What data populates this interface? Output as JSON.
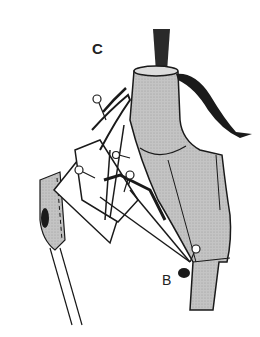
{
  "diagram": {
    "type": "illustration",
    "labels": {
      "c": "C",
      "b": "B"
    },
    "colors": {
      "form_fill": "#b8b8b8",
      "stroke": "#1a1a1a",
      "background": "#ffffff",
      "post": "#2a2a2a"
    }
  }
}
